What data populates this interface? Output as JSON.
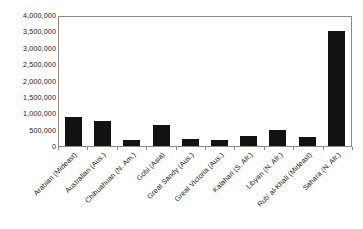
{
  "chart_data": {
    "type": "bar",
    "title": "",
    "xlabel": "",
    "ylabel": "",
    "ylim": [
      0,
      4000000
    ],
    "ytick_step": 500000,
    "grid": false,
    "legend": null,
    "bar_color": "#121212",
    "plot_border_color": "#8a8a8a",
    "background_color": "#ffffff",
    "categories": [
      "Arabian (Mideast)",
      "Australian (Aus.)",
      "Chihuahuan (N. Am.)",
      "Gobi (Asia)",
      "Great Sandy (Aus.)",
      "Great Victoria (Aus.)",
      "Kalahari (S. Afr.)",
      "Libyan (N. Afr.)",
      "Rub' al-Khali (Mideast)",
      "Sahara (N. Afr.)"
    ],
    "values": [
      900000,
      770000,
      180000,
      650000,
      220000,
      170000,
      300000,
      500000,
      280000,
      3500000
    ],
    "ytick_labels": [
      "4,000,000",
      "3,500,000",
      "3,000,000",
      "2,500,000",
      "2,000,000",
      "1,500,000",
      "1,000,000",
      "500,000",
      "0"
    ],
    "ytick_values": [
      4000000,
      3500000,
      3000000,
      2500000,
      2000000,
      1500000,
      1000000,
      500000,
      0
    ]
  }
}
